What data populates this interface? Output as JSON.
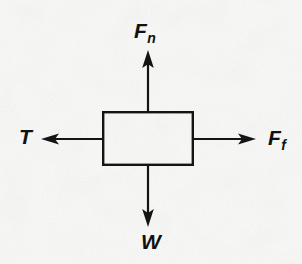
{
  "figure": {
    "type": "free-body-force-diagram",
    "background_color": "#f8f8f7",
    "stroke_color": "#111111",
    "body": {
      "shape": "rectangle",
      "x": 103,
      "y": 112,
      "width": 90,
      "height": 53,
      "fill": "none",
      "stroke_width": 2.4
    },
    "center": {
      "x": 148,
      "y": 139
    },
    "forces": [
      {
        "id": "normal-force",
        "label_main": "F",
        "label_sub": "n",
        "direction": "up",
        "from": {
          "x": 148,
          "y": 112
        },
        "to": {
          "x": 148,
          "y": 52
        },
        "label_x": 152,
        "label_y": 33
      },
      {
        "id": "friction-force",
        "label_main": "F",
        "label_sub": "f",
        "direction": "right",
        "from": {
          "x": 193,
          "y": 139
        },
        "to": {
          "x": 256,
          "y": 139
        },
        "label_x": 276,
        "label_y": 140
      },
      {
        "id": "tension-force",
        "label_main": "T",
        "label_sub": "",
        "direction": "left",
        "from": {
          "x": 103,
          "y": 139
        },
        "to": {
          "x": 41,
          "y": 139
        },
        "label_x": 27,
        "label_y": 139
      },
      {
        "id": "weight-force",
        "label_main": "W",
        "label_sub": "",
        "direction": "down",
        "from": {
          "x": 148,
          "y": 165
        },
        "to": {
          "x": 148,
          "y": 226
        },
        "label_x": 150,
        "label_y": 244
      }
    ]
  },
  "labels": {
    "normal": {
      "main": "F",
      "sub": "n"
    },
    "friction": {
      "main": "F",
      "sub": "f"
    },
    "tension": {
      "main": "T",
      "sub": ""
    },
    "weight": {
      "main": "W",
      "sub": ""
    }
  }
}
